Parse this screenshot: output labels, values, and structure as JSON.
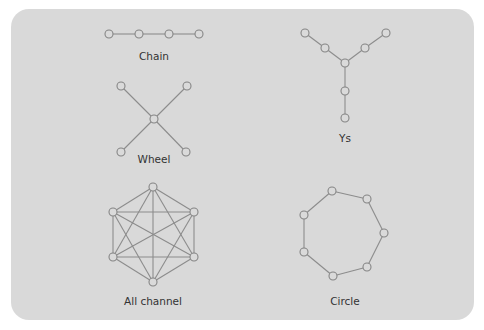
{
  "figure": {
    "background_color": "#d9d9d9",
    "edge_color": "#8c8c8c",
    "node_stroke_color": "#858585",
    "label_color": "#333333",
    "networks": [
      {
        "id": "chain",
        "label": "Chain",
        "label_pos": [
          154,
          60
        ],
        "nodes": [
          [
            109,
            34
          ],
          [
            139,
            34
          ],
          [
            169,
            34
          ],
          [
            199,
            34
          ]
        ],
        "edges": [
          [
            0,
            1
          ],
          [
            1,
            2
          ],
          [
            2,
            3
          ]
        ]
      },
      {
        "id": "wheel",
        "label": "Wheel",
        "label_pos": [
          154,
          163
        ],
        "nodes": [
          [
            121,
            86
          ],
          [
            187,
            86
          ],
          [
            154,
            119
          ],
          [
            121,
            152
          ],
          [
            186,
            152
          ]
        ],
        "edges": [
          [
            0,
            2
          ],
          [
            1,
            2
          ],
          [
            2,
            3
          ],
          [
            2,
            4
          ]
        ]
      },
      {
        "id": "ys",
        "label": "Ys",
        "label_pos": [
          345,
          142
        ],
        "nodes": [
          [
            305,
            33
          ],
          [
            325,
            48
          ],
          [
            345,
            63
          ],
          [
            365,
            48
          ],
          [
            386,
            33
          ],
          [
            345,
            91
          ],
          [
            345,
            118
          ]
        ],
        "edges": [
          [
            0,
            1
          ],
          [
            1,
            2
          ],
          [
            2,
            3
          ],
          [
            3,
            4
          ],
          [
            2,
            5
          ],
          [
            5,
            6
          ]
        ]
      },
      {
        "id": "all-channel",
        "label": "All channel",
        "label_pos": [
          153,
          305
        ],
        "nodes": [
          [
            153,
            187
          ],
          [
            194,
            212
          ],
          [
            194,
            257
          ],
          [
            153,
            282
          ],
          [
            113,
            257
          ],
          [
            113,
            212
          ]
        ],
        "edges": [
          [
            0,
            1
          ],
          [
            0,
            2
          ],
          [
            0,
            3
          ],
          [
            0,
            4
          ],
          [
            0,
            5
          ],
          [
            1,
            2
          ],
          [
            1,
            3
          ],
          [
            1,
            4
          ],
          [
            1,
            5
          ],
          [
            2,
            3
          ],
          [
            2,
            4
          ],
          [
            2,
            5
          ],
          [
            3,
            4
          ],
          [
            3,
            5
          ],
          [
            4,
            5
          ]
        ]
      },
      {
        "id": "circle",
        "label": "Circle",
        "label_pos": [
          345,
          305
        ],
        "nodes": [
          [
            332,
            191
          ],
          [
            367,
            199
          ],
          [
            384,
            233
          ],
          [
            367,
            267
          ],
          [
            333,
            276
          ],
          [
            304,
            252
          ],
          [
            304,
            215
          ]
        ],
        "edges": [
          [
            0,
            1
          ],
          [
            1,
            2
          ],
          [
            2,
            3
          ],
          [
            3,
            4
          ],
          [
            4,
            5
          ],
          [
            5,
            6
          ],
          [
            6,
            0
          ]
        ]
      }
    ]
  }
}
